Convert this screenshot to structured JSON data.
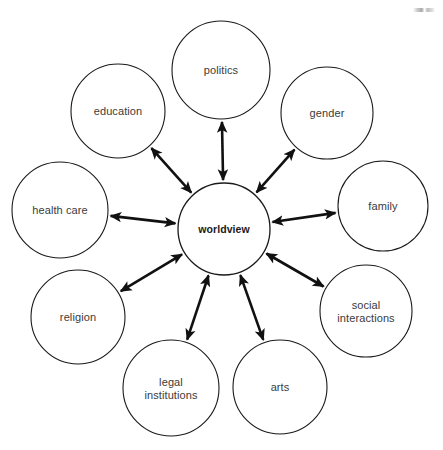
{
  "diagram": {
    "center": {
      "id": "worldview",
      "label": "worldview",
      "cx": 224,
      "cy": 229,
      "r": 46
    },
    "nodes": [
      {
        "id": "politics",
        "label": "politics",
        "cx": 221,
        "cy": 70,
        "r": 49
      },
      {
        "id": "gender",
        "label": "gender",
        "cx": 327,
        "cy": 113,
        "r": 46
      },
      {
        "id": "family",
        "label": "family",
        "cx": 383,
        "cy": 206,
        "r": 45
      },
      {
        "id": "social-interactions",
        "label": "social\ninteractions",
        "cx": 366,
        "cy": 311,
        "r": 46
      },
      {
        "id": "arts",
        "label": "arts",
        "cx": 280,
        "cy": 387,
        "r": 47
      },
      {
        "id": "legal-institutions",
        "label": "legal\ninstitutions",
        "cx": 171,
        "cy": 388,
        "r": 48
      },
      {
        "id": "religion",
        "label": "religion",
        "cx": 78,
        "cy": 317,
        "r": 47
      },
      {
        "id": "health-care",
        "label": "health care",
        "cx": 60,
        "cy": 210,
        "r": 48
      },
      {
        "id": "education",
        "label": "education",
        "cx": 118,
        "cy": 111,
        "r": 47
      }
    ],
    "connectors": [
      {
        "from": "worldview",
        "to": "politics",
        "style": "double-arrow"
      },
      {
        "from": "worldview",
        "to": "gender",
        "style": "double-arrow"
      },
      {
        "from": "worldview",
        "to": "family",
        "style": "double-arrow"
      },
      {
        "from": "worldview",
        "to": "social-interactions",
        "style": "double-arrow"
      },
      {
        "from": "worldview",
        "to": "arts",
        "style": "double-arrow"
      },
      {
        "from": "worldview",
        "to": "legal-institutions",
        "style": "double-arrow"
      },
      {
        "from": "worldview",
        "to": "religion",
        "style": "double-arrow"
      },
      {
        "from": "worldview",
        "to": "health-care",
        "style": "double-arrow"
      },
      {
        "from": "worldview",
        "to": "education",
        "style": "double-arrow"
      }
    ],
    "colors": {
      "background": "#ffffff",
      "circle_stroke": "#1a1a1a",
      "connector": "#111111",
      "label_text": "#3b3b3b",
      "center_label_text": "#1a1a1a"
    }
  }
}
